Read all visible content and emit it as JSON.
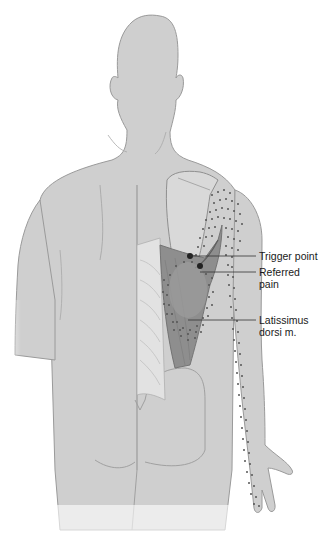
{
  "figure": {
    "muscle_highlighted": "Latissimus dorsi",
    "colors": {
      "skin": "#cfcfcf",
      "outline": "#9a9a9a",
      "muscle": "#8e8e8e",
      "muscle_dark": "#6e6e6e",
      "scapula": "#d9d9d9",
      "ribs": "#dedede",
      "dots": "#555555",
      "trigger_point": "#222222",
      "leader_line": "#333333",
      "background": "#ffffff"
    }
  },
  "labels": {
    "trigger_point": "Trigger point",
    "referred_pain_line1": "Referred",
    "referred_pain_line2": "pain",
    "muscle_line1": "Latissimus",
    "muscle_line2": "dorsi m."
  }
}
